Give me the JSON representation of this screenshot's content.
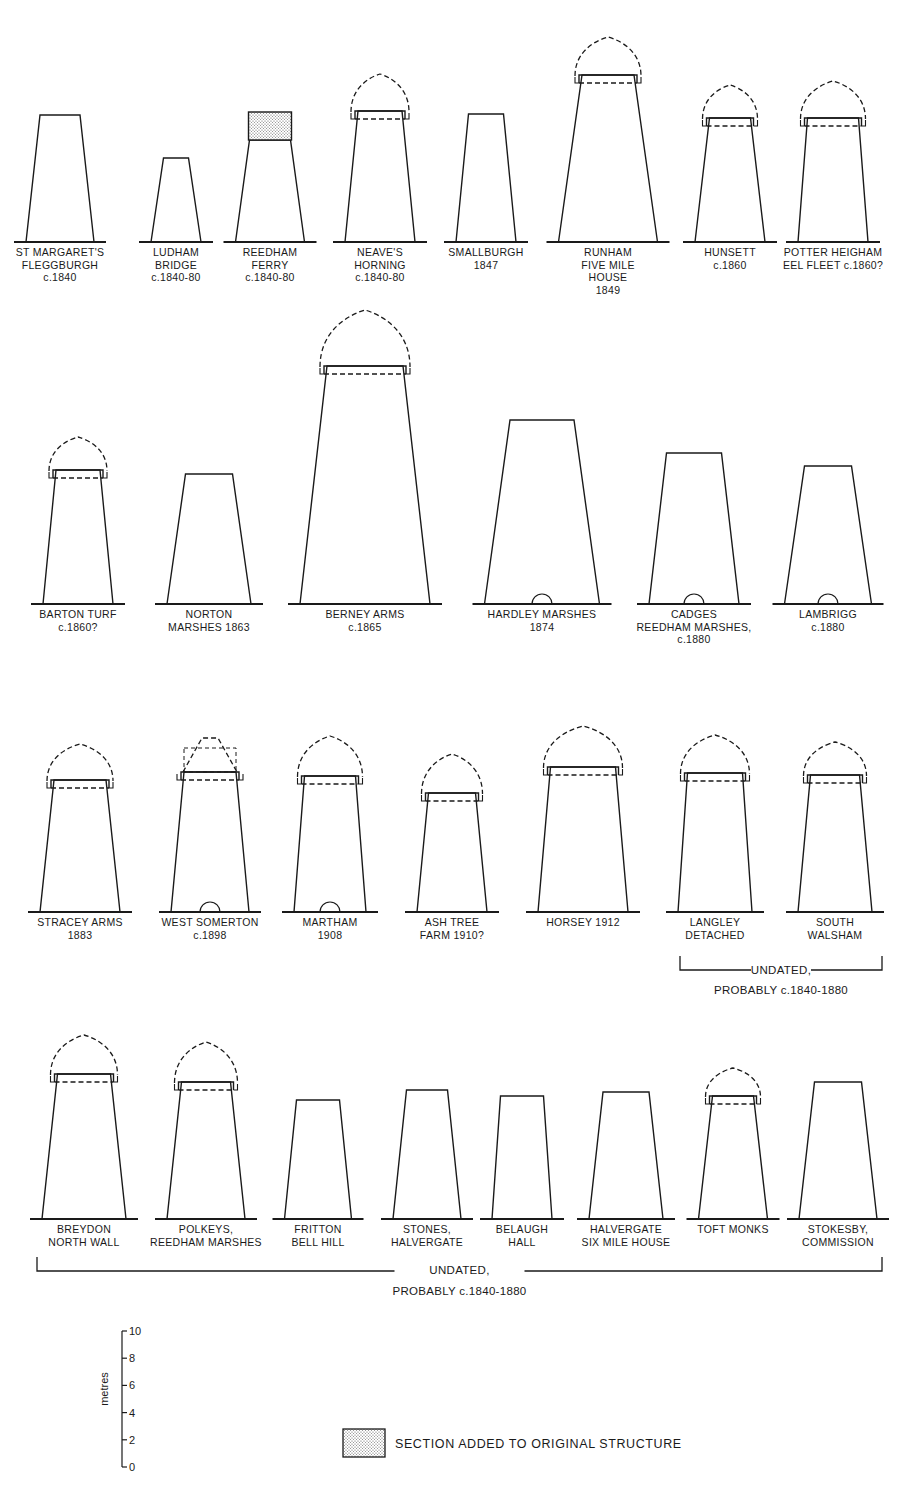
{
  "colors": {
    "ink": "#1a1a1a",
    "background": "#ffffff",
    "stipple": "#d9d9d9"
  },
  "mills": [
    {
      "id": "st-margarets",
      "label": [
        "ST MARGARET'S",
        "FLEGGBURGH",
        "c.1840"
      ],
      "cx": 60,
      "ground": 242,
      "bot_w": 68,
      "top_w": 40,
      "top": 115,
      "cap": "none",
      "door": false,
      "added": null
    },
    {
      "id": "ludham-bridge",
      "label": [
        "LUDHAM",
        "BRIDGE",
        "c.1840-80"
      ],
      "cx": 176,
      "ground": 242,
      "bot_w": 50,
      "top_w": 25,
      "top": 158,
      "cap": "none",
      "door": false,
      "added": null
    },
    {
      "id": "reedham-ferry",
      "label": [
        "REEDHAM",
        "FERRY",
        "c.1840-80"
      ],
      "cx": 270,
      "ground": 242,
      "bot_w": 69,
      "top_w": 41,
      "top": 140,
      "cap": "none",
      "door": false,
      "added": {
        "top": 112,
        "bottom": 140
      }
    },
    {
      "id": "neaves",
      "label": [
        "NEAVE'S",
        "HORNING",
        "c.1840-80"
      ],
      "cx": 380,
      "ground": 242,
      "bot_w": 70,
      "top_w": 44,
      "top": 111,
      "cap": "ogee",
      "cap_top": 74,
      "door": false,
      "added": null
    },
    {
      "id": "smallburgh",
      "label": [
        "SMALLBURGH",
        "1847"
      ],
      "cx": 486,
      "ground": 242,
      "bot_w": 60,
      "top_w": 35,
      "top": 114,
      "cap": "none",
      "door": false,
      "added": null
    },
    {
      "id": "runham",
      "label": [
        "RUNHAM",
        "FIVE MILE",
        "HOUSE",
        "1849"
      ],
      "cx": 608,
      "ground": 242,
      "bot_w": 99,
      "top_w": 52,
      "top": 75,
      "cap": "ogee",
      "cap_top": 37,
      "door": false,
      "added": null
    },
    {
      "id": "hunsett",
      "label": [
        "HUNSETT",
        "c.1860"
      ],
      "cx": 730,
      "ground": 242,
      "bot_w": 70,
      "top_w": 41,
      "top": 118,
      "cap": "ogee",
      "cap_top": 85,
      "door": false,
      "added": null
    },
    {
      "id": "potter-heigham",
      "label": [
        "POTTER HEIGHAM",
        "EEL FLEET c.1860?"
      ],
      "cx": 833,
      "ground": 242,
      "bot_w": 70,
      "top_w": 51,
      "top": 118,
      "cap": "ogee",
      "cap_top": 81,
      "door": false,
      "added": null
    },
    {
      "id": "barton-turf",
      "label": [
        "BARTON TURF",
        "c.1860?"
      ],
      "cx": 78,
      "ground": 604,
      "bot_w": 70,
      "top_w": 44,
      "top": 470,
      "cap": "ogee",
      "cap_top": 437,
      "door": false,
      "added": null
    },
    {
      "id": "norton-marshes",
      "label": [
        "NORTON",
        "MARSHES 1863"
      ],
      "cx": 209,
      "ground": 604,
      "bot_w": 84,
      "top_w": 47,
      "top": 474,
      "cap": "none",
      "door": false,
      "added": null
    },
    {
      "id": "berney-arms",
      "label": [
        "BERNEY ARMS",
        "c.1865"
      ],
      "cx": 365,
      "ground": 604,
      "bot_w": 130,
      "top_w": 76,
      "top": 366,
      "cap": "ogee",
      "cap_top": 310,
      "door": false,
      "added": null
    },
    {
      "id": "hardley-marshes",
      "label": [
        "HARDLEY MARSHES",
        "1874"
      ],
      "cx": 542,
      "ground": 604,
      "bot_w": 115,
      "top_w": 64,
      "top": 420,
      "cap": "none",
      "door": true,
      "added": null
    },
    {
      "id": "cadges",
      "label": [
        "CADGES",
        "REEDHAM MARSHES,",
        "c.1880"
      ],
      "cx": 694,
      "ground": 604,
      "bot_w": 90,
      "top_w": 55,
      "top": 453,
      "cap": "none",
      "door": true,
      "added": null
    },
    {
      "id": "lambrigg",
      "label": [
        "LAMBRIGG",
        "c.1880"
      ],
      "cx": 828,
      "ground": 604,
      "bot_w": 87,
      "top_w": 47,
      "top": 466,
      "cap": "none",
      "door": true,
      "added": null
    },
    {
      "id": "stracey-arms",
      "label": [
        "STRACEY ARMS",
        "1883"
      ],
      "cx": 80,
      "ground": 912,
      "bot_w": 80,
      "top_w": 52,
      "top": 780,
      "cap": "ogee",
      "cap_top": 744,
      "door": false,
      "added": null
    },
    {
      "id": "west-somerton",
      "label": [
        "WEST SOMERTON",
        "c.1898"
      ],
      "cx": 210,
      "ground": 912,
      "bot_w": 78,
      "top_w": 52,
      "top": 772,
      "cap": "conical",
      "cap_top": 738,
      "door": true,
      "added": null
    },
    {
      "id": "martham",
      "label": [
        "MARTHAM",
        "1908"
      ],
      "cx": 330,
      "ground": 912,
      "bot_w": 72,
      "top_w": 51,
      "top": 776,
      "cap": "ogee",
      "cap_top": 736,
      "door": true,
      "added": null
    },
    {
      "id": "ash-tree-farm",
      "label": [
        "ASH TREE",
        "FARM 1910?"
      ],
      "cx": 452,
      "ground": 912,
      "bot_w": 70,
      "top_w": 47,
      "top": 793,
      "cap": "ogee",
      "cap_top": 754,
      "door": false,
      "added": null
    },
    {
      "id": "horsey",
      "label": [
        "HORSEY 1912"
      ],
      "cx": 583,
      "ground": 912,
      "bot_w": 90,
      "top_w": 65,
      "top": 767,
      "cap": "ogee",
      "cap_top": 726,
      "door": false,
      "added": null
    },
    {
      "id": "langley-detached",
      "label": [
        "LANGLEY",
        "DETACHED"
      ],
      "cx": 715,
      "ground": 912,
      "bot_w": 74,
      "top_w": 55,
      "top": 773,
      "cap": "ogee",
      "cap_top": 735,
      "door": false,
      "added": null
    },
    {
      "id": "south-walsham",
      "label": [
        "SOUTH",
        "WALSHAM"
      ],
      "cx": 835,
      "ground": 912,
      "bot_w": 74,
      "top_w": 49,
      "top": 775,
      "cap": "ogee",
      "cap_top": 742,
      "door": false,
      "added": null
    },
    {
      "id": "breydon",
      "label": [
        "BREYDON",
        "NORTH WALL"
      ],
      "cx": 84,
      "ground": 1219,
      "bot_w": 84,
      "top_w": 53,
      "top": 1074,
      "cap": "ogee",
      "cap_top": 1035,
      "door": false,
      "added": null
    },
    {
      "id": "polkeys",
      "label": [
        "POLKEYS,",
        "REEDHAM MARSHES"
      ],
      "cx": 206,
      "ground": 1219,
      "bot_w": 78,
      "top_w": 49,
      "top": 1082,
      "cap": "ogee",
      "cap_top": 1042,
      "door": false,
      "added": null
    },
    {
      "id": "fritton",
      "label": [
        "FRITTON",
        "BELL HILL"
      ],
      "cx": 318,
      "ground": 1219,
      "bot_w": 67,
      "top_w": 43,
      "top": 1100,
      "cap": "none",
      "door": false,
      "added": null
    },
    {
      "id": "stones",
      "label": [
        "STONES,",
        "HALVERGATE"
      ],
      "cx": 427,
      "ground": 1219,
      "bot_w": 68,
      "top_w": 41,
      "top": 1090,
      "cap": "none",
      "door": false,
      "added": null
    },
    {
      "id": "belaugh",
      "label": [
        "BELAUGH",
        "HALL"
      ],
      "cx": 522,
      "ground": 1219,
      "bot_w": 60,
      "top_w": 43,
      "top": 1096,
      "cap": "none",
      "door": false,
      "added": null
    },
    {
      "id": "halvergate-six-mile",
      "label": [
        "HALVERGATE",
        "SIX MILE HOUSE"
      ],
      "cx": 626,
      "ground": 1219,
      "bot_w": 74,
      "top_w": 46,
      "top": 1092,
      "cap": "none",
      "door": false,
      "added": null
    },
    {
      "id": "toft-monks",
      "label": [
        "TOFT MONKS"
      ],
      "cx": 733,
      "ground": 1219,
      "bot_w": 69,
      "top_w": 41,
      "top": 1096,
      "cap": "ogee",
      "cap_top": 1068,
      "door": false,
      "added": null
    },
    {
      "id": "stokesby",
      "label": [
        "STOKESBY,",
        "COMMISSION"
      ],
      "cx": 838,
      "ground": 1219,
      "bot_w": 78,
      "top_w": 47,
      "top": 1082,
      "cap": "none",
      "door": false,
      "added": null
    }
  ],
  "brackets": [
    {
      "id": "bracket-row3",
      "x1": 680,
      "x2": 882,
      "y": 970,
      "tick": 14,
      "line1": "UNDATED,",
      "line2": "PROBABLY c.1840-1880",
      "gap": 60,
      "line1_y": 974,
      "line2_y": 994
    },
    {
      "id": "bracket-row4",
      "x1": 37,
      "x2": 882,
      "y": 1271,
      "tick": 14,
      "line1": "UNDATED,",
      "line2": "PROBABLY c.1840-1880",
      "gap": 130,
      "line1_y": 1274,
      "line2_y": 1295
    }
  ],
  "scale": {
    "unit_label": "metres",
    "x": 122,
    "y_top": 1331,
    "y_bottom": 1467,
    "ticks": [
      "10",
      "8",
      "6",
      "4",
      "2",
      "0"
    ]
  },
  "legend": {
    "text": "SECTION ADDED TO ORIGINAL STRUCTURE",
    "swatch": {
      "x": 343,
      "y": 1429,
      "w": 42,
      "h": 28
    }
  },
  "chart_data": {
    "type": "table",
    "scale_unit": "metres",
    "scale_range": [
      0,
      10
    ],
    "legend": [
      "SECTION ADDED TO ORIGINAL STRUCTURE"
    ],
    "groups": [
      "dated c.1840-1912",
      "UNDATED, PROBABLY c.1840-1880"
    ]
  }
}
